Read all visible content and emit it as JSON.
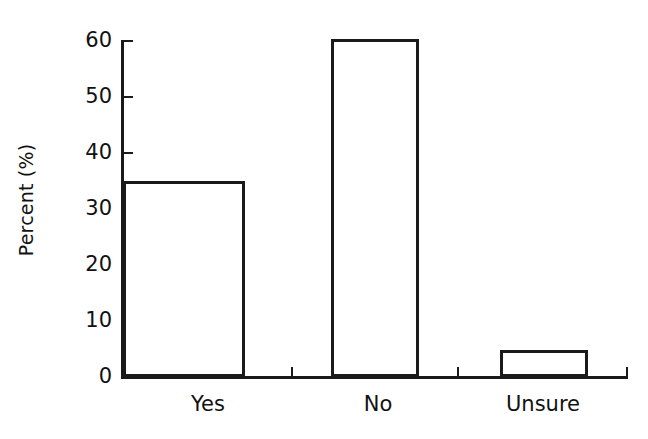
{
  "chart_data": {
    "type": "bar",
    "title": "",
    "xlabel": "",
    "ylabel": "Percent (%)",
    "categories": [
      "Yes",
      "No",
      "Unsure"
    ],
    "values": [
      35,
      60.3,
      4.8
    ],
    "ylim": [
      0,
      60
    ],
    "yticks": [
      0,
      10,
      20,
      30,
      40,
      50,
      60
    ],
    "ytick_labels": [
      "0",
      "10",
      "20",
      "30",
      "40",
      "50",
      "60"
    ],
    "grid": false,
    "legend": null,
    "bar_style": {
      "fill": "#ffffff",
      "edge": "#1a1a1a",
      "edge_width_px": 3
    }
  },
  "axis": {
    "y_title": "Percent (%)",
    "tick_0": "0",
    "tick_10": "10",
    "tick_20": "20",
    "tick_30": "30",
    "tick_40": "40",
    "tick_50": "50",
    "tick_60": "60"
  },
  "categories": {
    "cat_0": "Yes",
    "cat_1": "No",
    "cat_2": "Unsure"
  }
}
